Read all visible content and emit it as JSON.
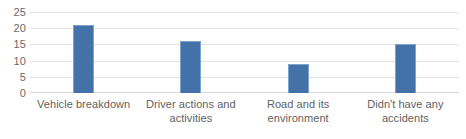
{
  "chart_data": {
    "type": "bar",
    "title": "",
    "subtitle": "",
    "xlabel": "",
    "ylabel": "",
    "categories": [
      "Vehicle breakdown",
      "Driver actions and activities",
      "Road and its environment",
      "Didn't have any accidents"
    ],
    "values": [
      21,
      16,
      9,
      15
    ],
    "ylim": [
      0,
      25
    ],
    "yticks": [
      0,
      5,
      10,
      15,
      20,
      25
    ],
    "ytick_labels": [
      "0",
      "5",
      "10",
      "15",
      "20",
      "25"
    ],
    "grid": true,
    "grid_axis": "y",
    "legend": false,
    "legend_position": "none",
    "series": [
      {
        "name": "",
        "values": [
          21,
          16,
          9,
          15
        ]
      }
    ]
  },
  "style": {
    "bar_color": "#4472a8",
    "bar_edge_color": "#7ba2d0",
    "gridline_color": "#e3e3e3",
    "axis_text_color": "#6a6a6a",
    "background_color": "#ffffff"
  }
}
